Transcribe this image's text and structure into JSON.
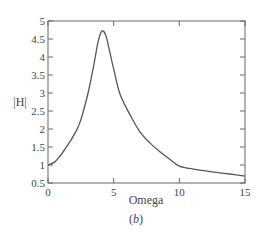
{
  "chart_data": {
    "type": "line",
    "title": "",
    "xlabel": "Omega",
    "ylabel": "|H|",
    "caption_prefix": "(",
    "caption_letter": "b",
    "caption_suffix": ")",
    "xlim": [
      0,
      15
    ],
    "ylim": [
      0.5,
      5
    ],
    "grid": false,
    "legend": null,
    "xticks": [
      0,
      5,
      10,
      15
    ],
    "xtick_labels": [
      "0",
      "5",
      "10",
      "15"
    ],
    "yticks": [
      0.5,
      1,
      1.5,
      2,
      2.5,
      3,
      3.5,
      4,
      4.5,
      5
    ],
    "ytick_labels": [
      "0.5",
      "1",
      "1.5",
      "2",
      "2.5",
      "3",
      "3.5",
      "4",
      "4.5",
      "5"
    ],
    "series": [
      {
        "name": "|H|",
        "color": "#555555",
        "x": [
          0,
          0.5,
          0.92,
          1.5,
          2.0,
          2.44,
          3.05,
          3.5,
          3.8,
          4.1,
          4.4,
          4.7,
          5.0,
          5.5,
          6.3,
          7.0,
          7.8,
          8.55,
          9.3,
          10.0,
          11.2,
          12.5,
          13.8,
          15.0
        ],
        "y": [
          1.0,
          1.08,
          1.25,
          1.55,
          1.85,
          2.19,
          3.0,
          3.8,
          4.4,
          4.72,
          4.6,
          4.15,
          3.67,
          2.95,
          2.36,
          1.92,
          1.6,
          1.36,
          1.15,
          0.97,
          0.88,
          0.81,
          0.75,
          0.69
        ]
      }
    ]
  }
}
